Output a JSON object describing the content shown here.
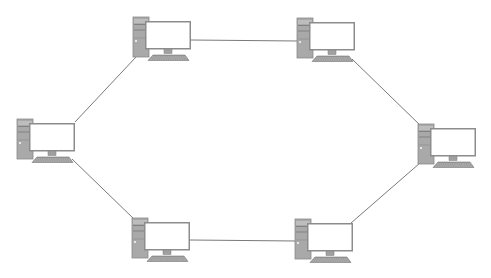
{
  "diagram": {
    "type": "ring-network-topology",
    "colors": {
      "background": "#ffffff",
      "link": "#7a7a7a",
      "tower": "#a9a9a9",
      "tower_dark": "#7d7d7d",
      "monitor_frame": "#8c8c8c",
      "screen": "#ffffff",
      "keyboard": "#9a9a9a"
    },
    "nodes": [
      {
        "id": "pc-top-left",
        "label": "",
        "x": 131,
        "y": 16
      },
      {
        "id": "pc-top-right",
        "label": "",
        "x": 295,
        "y": 17
      },
      {
        "id": "pc-right",
        "label": "",
        "x": 416,
        "y": 123
      },
      {
        "id": "pc-bottom-right",
        "label": "",
        "x": 293,
        "y": 218
      },
      {
        "id": "pc-bottom-left",
        "label": "",
        "x": 130,
        "y": 217
      },
      {
        "id": "pc-left",
        "label": "",
        "x": 15,
        "y": 118
      }
    ],
    "links": [
      {
        "from": "pc-top-left",
        "to": "pc-top-right",
        "x1": 191,
        "y1": 40,
        "x2": 298,
        "y2": 41
      },
      {
        "from": "pc-top-right",
        "to": "pc-right",
        "x1": 352,
        "y1": 59,
        "x2": 422,
        "y2": 127
      },
      {
        "from": "pc-right",
        "to": "pc-bottom-right",
        "x1": 420,
        "y1": 163,
        "x2": 351,
        "y2": 223
      },
      {
        "from": "pc-bottom-right",
        "to": "pc-bottom-left",
        "x1": 296,
        "y1": 241,
        "x2": 190,
        "y2": 240
      },
      {
        "from": "pc-bottom-left",
        "to": "pc-left",
        "x1": 134,
        "y1": 219,
        "x2": 72,
        "y2": 159
      },
      {
        "from": "pc-left",
        "to": "pc-top-left",
        "x1": 75,
        "y1": 122,
        "x2": 136,
        "y2": 57
      }
    ]
  }
}
